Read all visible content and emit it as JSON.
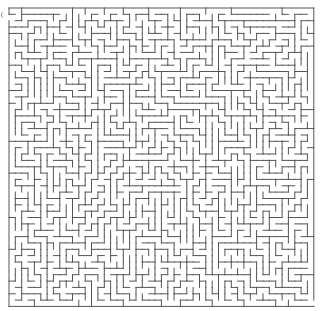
{
  "maze": {
    "cols": 48,
    "rows": 47,
    "origin_x": 9,
    "origin_y": 8,
    "cell_size": 6.35,
    "wall_color": "#555555",
    "background": "#ffffff",
    "entrance": {
      "side": "left",
      "row": 1
    },
    "exit": {
      "side": "right",
      "row": 46
    },
    "seed": 12345
  }
}
